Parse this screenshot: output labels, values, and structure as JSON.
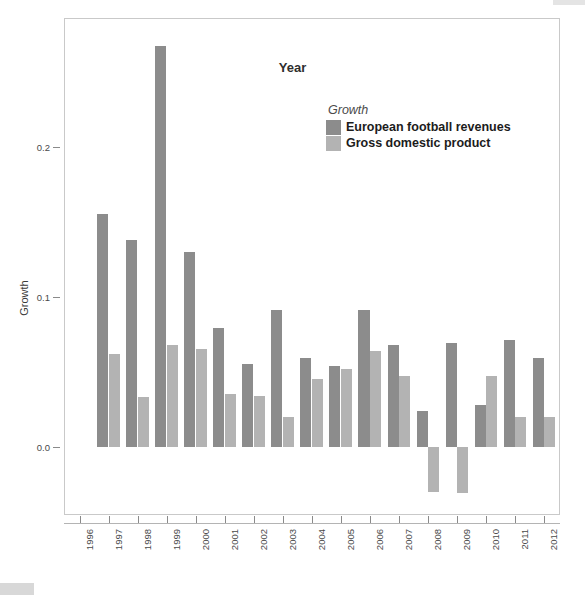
{
  "chart_data": {
    "type": "bar",
    "title": "",
    "xlabel": "Year",
    "ylabel": "Growth",
    "categories": [
      "1996",
      "1997",
      "1998",
      "1999",
      "2000",
      "2001",
      "2002",
      "2003",
      "2004",
      "2005",
      "2006",
      "2007",
      "2008",
      "2009",
      "2010",
      "2011",
      "2012"
    ],
    "series": [
      {
        "name": "European football revenues",
        "color": "#8c8c8c",
        "values": [
          null,
          0.155,
          0.138,
          0.267,
          0.13,
          0.079,
          0.055,
          0.091,
          0.059,
          0.054,
          0.091,
          0.068,
          0.024,
          0.069,
          0.028,
          0.071,
          0.059
        ]
      },
      {
        "name": "Gross domestic product",
        "color": "#b3b3b3",
        "values": [
          null,
          0.062,
          0.033,
          0.068,
          0.065,
          0.035,
          0.034,
          0.02,
          0.045,
          0.052,
          0.064,
          0.047,
          -0.03,
          -0.031,
          0.047,
          0.02,
          0.02
        ]
      }
    ],
    "ylim": [
      -0.045,
      0.285
    ],
    "yticks": [
      0.0,
      0.1,
      0.2
    ],
    "ytick_labels": [
      "0.0",
      "0.1",
      "0.2"
    ],
    "grid": false,
    "legend_position": "top-right",
    "zero_line": 0.0
  },
  "axes": {
    "y_title": "Growth",
    "x_title": "Year"
  },
  "legend": {
    "title": "Growth",
    "entries": [
      {
        "label": "European football revenues",
        "color": "#8c8c8c"
      },
      {
        "label": "Gross domestic product",
        "color": "#b3b3b3"
      }
    ]
  }
}
